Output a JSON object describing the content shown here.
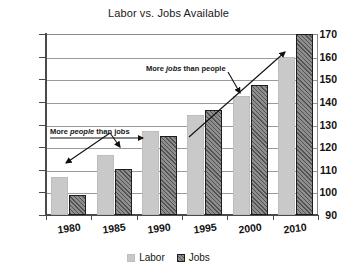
{
  "chart_data": {
    "type": "bar",
    "title": "Labor vs. Jobs Available",
    "xlabel": "",
    "ylabel": "",
    "categories": [
      "1980",
      "1985",
      "1990",
      "1995",
      "2000",
      "2010"
    ],
    "series": [
      {
        "name": "Labor",
        "values": [
          107,
          116.5,
          127,
          134,
          142.5,
          160
        ]
      },
      {
        "name": "Jobs",
        "values": [
          99,
          110.5,
          125,
          136.5,
          147.5,
          170
        ]
      }
    ],
    "ylim": [
      90,
      170
    ],
    "ytick_values": [
      90,
      100,
      110,
      120,
      130,
      140,
      150,
      160,
      170
    ],
    "ytick_labels": [
      "90",
      "100",
      "110",
      "120",
      "130",
      "140",
      "150",
      "160",
      "170"
    ],
    "grid": true,
    "legend_position": "bottom",
    "legend": [
      "Labor",
      "Jobs"
    ],
    "annotations": [
      {
        "text_prefix": "More ",
        "text_emphasis": "people",
        "text_suffix": " than jobs",
        "full_text": "More people than jobs"
      },
      {
        "text_prefix": "More ",
        "text_emphasis": "jobs",
        "text_suffix": " than people",
        "full_text": "More jobs than people"
      }
    ],
    "colors": {
      "labor": "#c9c9c9",
      "jobs": "#8e8e8e",
      "jobs_border": "#1d1d1d",
      "grid": "#9a9a9a",
      "axis": "#4a4a4a",
      "text": "#111111",
      "background": "#ffffff"
    }
  }
}
